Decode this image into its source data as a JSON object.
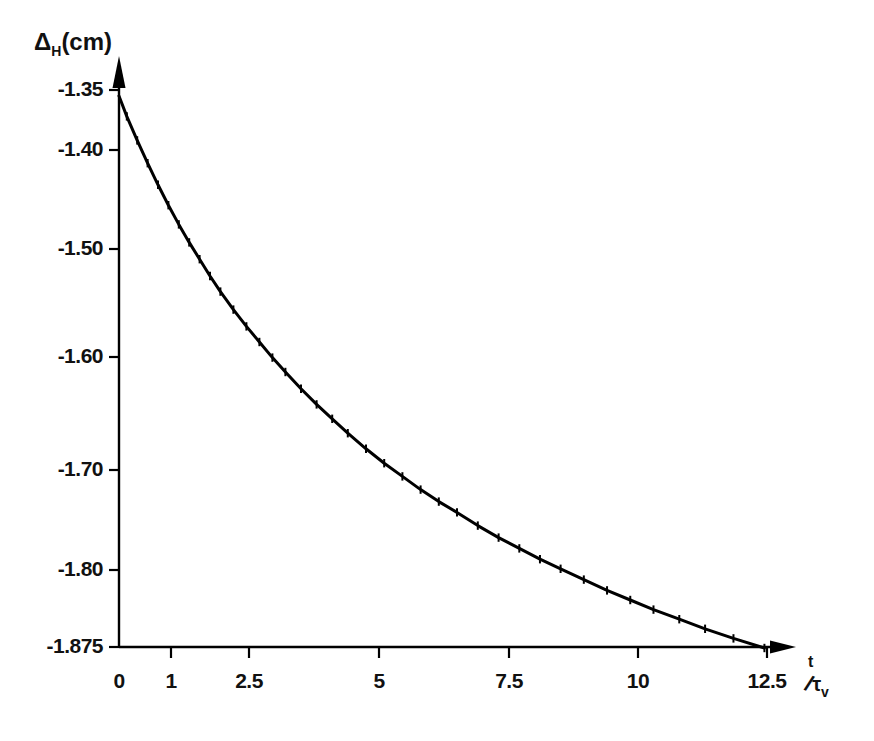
{
  "chart_data": {
    "type": "line",
    "title": "",
    "subtitle": "",
    "xlabel": "t/τv",
    "ylabel": "ΔH(cm)",
    "xlabel_parts": {
      "numerator": "t",
      "slash": "/",
      "denominator": "τ",
      "denominator_sub": "v"
    },
    "ylabel_parts": {
      "symbol": "Δ",
      "sub": "H",
      "unit": "(cm)"
    },
    "grid": false,
    "legend": null,
    "xlim": [
      0,
      12.5
    ],
    "ylim": [
      -1.875,
      -1.35
    ],
    "xticks": [
      0,
      1,
      2.5,
      5,
      7.5,
      10,
      12.5
    ],
    "xtick_labels": [
      "0",
      "1",
      "2.5",
      "5",
      "7.5",
      "10",
      "12.5"
    ],
    "yticks": [
      -1.35,
      -1.4,
      -1.5,
      -1.6,
      -1.7,
      -1.8,
      -1.875
    ],
    "ytick_labels": [
      "-1.35",
      "-1.40",
      "-1.50",
      "-1.60",
      "-1.70",
      "-1.80",
      "-1.875"
    ],
    "ytick_pixel_positions": [
      90,
      150,
      249,
      357,
      470,
      570,
      647
    ],
    "xtick_pixel_positions": [
      119,
      171,
      249,
      379,
      509,
      638,
      767
    ],
    "axis_style": {
      "x_arrow": true,
      "y_arrow": true,
      "color": "#000000",
      "line_width": 2
    },
    "marker": "tick-cross",
    "series": [
      {
        "name": "ΔH(t)",
        "x": [
          0.0,
          0.15,
          0.35,
          0.55,
          0.75,
          0.95,
          1.15,
          1.35,
          1.55,
          1.75,
          1.95,
          2.2,
          2.45,
          2.7,
          2.95,
          3.2,
          3.5,
          3.8,
          4.1,
          4.4,
          4.75,
          5.1,
          5.45,
          5.8,
          6.15,
          6.5,
          6.9,
          7.3,
          7.7,
          8.1,
          8.5,
          8.95,
          9.4,
          9.85,
          10.3,
          10.8,
          11.3,
          11.85,
          12.45
        ],
        "y": [
          -1.355,
          -1.372,
          -1.392,
          -1.411,
          -1.429,
          -1.446,
          -1.462,
          -1.477,
          -1.491,
          -1.505,
          -1.518,
          -1.533,
          -1.547,
          -1.56,
          -1.573,
          -1.585,
          -1.599,
          -1.612,
          -1.624,
          -1.636,
          -1.649,
          -1.661,
          -1.672,
          -1.683,
          -1.693,
          -1.702,
          -1.713,
          -1.723,
          -1.732,
          -1.741,
          -1.749,
          -1.758,
          -1.767,
          -1.775,
          -1.783,
          -1.791,
          -1.799,
          -1.807,
          -1.815
        ]
      }
    ],
    "annotations": []
  },
  "figure": {
    "background": "#ffffff",
    "ink": "#000000"
  }
}
